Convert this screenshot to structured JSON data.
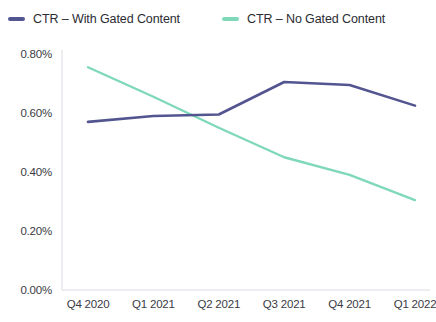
{
  "legend": {
    "position": "top-left",
    "items": [
      {
        "label": "CTR – With Gated Content",
        "color": "#52558f",
        "swatch": "line-swatch"
      },
      {
        "label": "CTR – No Gated Content",
        "color": "#7fd9b9",
        "swatch": "line-swatch"
      }
    ]
  },
  "axes": {
    "y_ticks": [
      "0.80%",
      "0.60%",
      "0.40%",
      "0.20%",
      "0.00%"
    ],
    "x_ticks": [
      "Q4 2020",
      "Q1 2021",
      "Q2 2021",
      "Q3 2021",
      "Q4 2021",
      "Q1 2022"
    ]
  },
  "chart_data": {
    "type": "line",
    "title": "",
    "subtitle": "",
    "xlabel": "",
    "ylabel": "",
    "categories": [
      "Q4 2020",
      "Q1 2021",
      "Q2 2021",
      "Q3 2021",
      "Q4 2021",
      "Q1 2022"
    ],
    "series": [
      {
        "name": "CTR – With Gated Content",
        "color": "#52558f",
        "values": [
          0.57,
          0.59,
          0.595,
          0.705,
          0.695,
          0.625
        ]
      },
      {
        "name": "CTR – No Gated Content",
        "color": "#7fd9b9",
        "values": [
          0.755,
          0.655,
          0.55,
          0.45,
          0.39,
          0.305
        ]
      }
    ],
    "value_unit": "%",
    "ylim": [
      0.0,
      0.8
    ],
    "y_tick_values": [
      0.8,
      0.6,
      0.4,
      0.2,
      0.0
    ],
    "grid": false,
    "legend_position": "top-left"
  }
}
